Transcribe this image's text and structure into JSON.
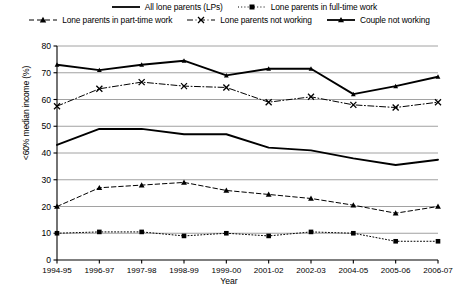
{
  "chart_data": {
    "type": "line",
    "title": "",
    "xlabel": "Year",
    "ylabel": "<60% median income (%)",
    "categories": [
      "1994-95",
      "1996-97",
      "1997-98",
      "1998-99",
      "1999-00",
      "2001-02",
      "2002-03",
      "2004-05",
      "2005-06",
      "2006-07"
    ],
    "ylim": [
      0,
      80
    ],
    "ytick_step": 10,
    "yticks": [
      "0",
      "10",
      "20",
      "30",
      "40",
      "50",
      "60",
      "70",
      "80"
    ],
    "grid": "horizontal",
    "legend_position": "top",
    "series": [
      {
        "name": "All lone parents (LPs)",
        "style": "solid-thick",
        "marker": "none",
        "color": "#000000",
        "values": [
          43,
          49,
          49,
          47,
          47,
          42,
          41,
          38,
          35.5,
          37.5
        ]
      },
      {
        "name": "Lone parents in full-time work",
        "style": "dotted",
        "marker": "square",
        "color": "#000000",
        "values": [
          10,
          10.5,
          10.5,
          9,
          10,
          9,
          10.5,
          10,
          7,
          7
        ]
      },
      {
        "name": "Lone parents in part-time work",
        "style": "dashed",
        "marker": "triangle",
        "color": "#000000",
        "values": [
          20,
          27,
          28,
          29,
          26,
          24.5,
          23,
          20.5,
          17.5,
          20
        ]
      },
      {
        "name": "Lone parents not working",
        "style": "dash-dot",
        "marker": "cross",
        "color": "#000000",
        "values": [
          57.5,
          64,
          66.5,
          65,
          64.5,
          59,
          61,
          58,
          57,
          59
        ]
      },
      {
        "name": "Couple not working",
        "style": "solid-thick",
        "marker": "triangle-small",
        "color": "#000000",
        "values": [
          73,
          71,
          73,
          74.5,
          69,
          71.5,
          71.5,
          62,
          65,
          68.5
        ]
      }
    ]
  },
  "legend": {
    "row1": [
      {
        "label": "All lone parents (LPs)",
        "key": "solid-thick"
      },
      {
        "label": "Lone parents in full-time work",
        "key": "dotted-square"
      }
    ],
    "row2": [
      {
        "label": "Lone parents in part-time work",
        "key": "dashed-triangle"
      },
      {
        "label": "Lone parents not working",
        "key": "dashdot-cross"
      },
      {
        "label": "Couple not working",
        "key": "solid-triangle"
      }
    ]
  }
}
